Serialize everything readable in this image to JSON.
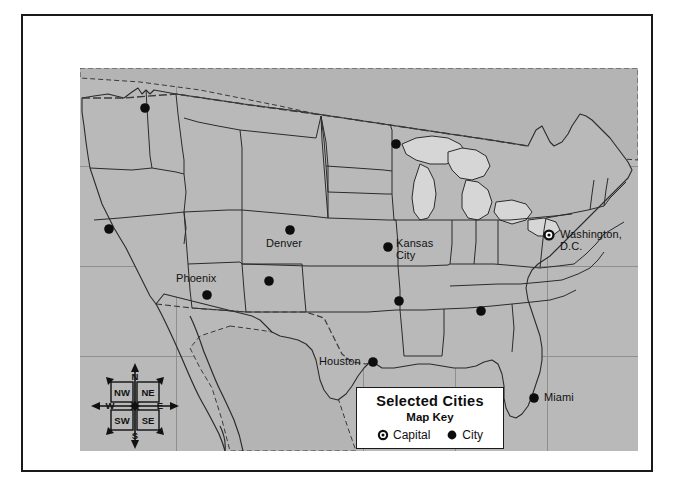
{
  "map": {
    "title": "Selected Cities",
    "subtitle": "Map Key",
    "land_color": "#b9b9b9",
    "lake_color": "#d6d6d6",
    "border_color": "#2b2b2b",
    "grid_color": "#8f8f8f",
    "marker_color": "#0d0d0d"
  },
  "legend": {
    "title": "Selected Cities",
    "subtitle": "Map Key",
    "items": [
      {
        "symbol": "capital-marker",
        "label": "Capital"
      },
      {
        "symbol": "city-marker",
        "label": "City"
      }
    ]
  },
  "compass": {
    "north": "N",
    "south": "S",
    "east": "E",
    "west": "W",
    "northwest": "NW",
    "northeast": "NE",
    "southwest": "SW",
    "southeast": "SE"
  },
  "cities": [
    {
      "name": "Seattle",
      "label": "",
      "type": "city",
      "x": 65,
      "y": 40,
      "label_x": 0,
      "label_y": 0,
      "labeled": false
    },
    {
      "name": "San Francisco",
      "label": "",
      "type": "city",
      "x": 29,
      "y": 161,
      "label_x": 0,
      "label_y": 0,
      "labeled": false
    },
    {
      "name": "Minneapolis",
      "label": "",
      "type": "city",
      "x": 316,
      "y": 76,
      "label_x": 0,
      "label_y": 0,
      "labeled": false
    },
    {
      "name": "Denver",
      "label": "Denver",
      "type": "city",
      "x": 210,
      "y": 162,
      "label_x": 186,
      "label_y": 170,
      "labeled": true
    },
    {
      "name": "Kansas City",
      "label": "Kansas\nCity",
      "type": "city",
      "x": 308,
      "y": 179,
      "label_x": 316,
      "label_y": 170,
      "labeled": true
    },
    {
      "name": "Phoenix",
      "label": "Phoenix",
      "type": "city",
      "x": 127,
      "y": 227,
      "label_x": 96,
      "label_y": 205,
      "labeled": true
    },
    {
      "name": "Albuquerque",
      "label": "",
      "type": "city",
      "x": 189,
      "y": 213,
      "label_x": 0,
      "label_y": 0,
      "labeled": false
    },
    {
      "name": "Memphis",
      "label": "",
      "type": "city",
      "x": 319,
      "y": 233,
      "label_x": 0,
      "label_y": 0,
      "labeled": false
    },
    {
      "name": "Atlanta",
      "label": "",
      "type": "city",
      "x": 401,
      "y": 243,
      "label_x": 0,
      "label_y": 0,
      "labeled": false
    },
    {
      "name": "Houston",
      "label": "Houston",
      "type": "city",
      "x": 293,
      "y": 294,
      "label_x": 239,
      "label_y": 288,
      "labeled": true
    },
    {
      "name": "Miami",
      "label": "Miami",
      "type": "city",
      "x": 454,
      "y": 330,
      "label_x": 464,
      "label_y": 324,
      "labeled": true
    },
    {
      "name": "Washington, D.C.",
      "label": "Washington, D.C.",
      "type": "capital",
      "x": 469,
      "y": 167,
      "label_x": 480,
      "label_y": 161,
      "labeled": true
    }
  ],
  "grid": {
    "vertical_x": [
      96,
      188,
      283,
      375,
      467
    ],
    "horizontal_y": [
      98,
      198,
      288
    ]
  }
}
